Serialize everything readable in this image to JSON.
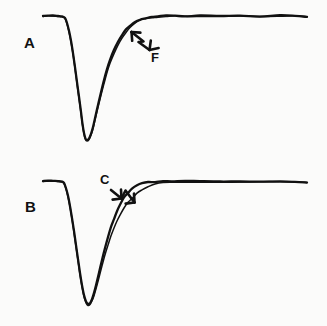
{
  "figure": {
    "width": 327,
    "height": 326,
    "background_color": "#fbfbfa",
    "trace_color": "#111111"
  },
  "panels": [
    {
      "id": "A",
      "label": "A",
      "annotations": [
        {
          "id": "F",
          "label": "F",
          "icon": "double-chevron-arrow-up-left-icon",
          "direction": "up-left"
        }
      ]
    },
    {
      "id": "B",
      "label": "B",
      "annotations": [
        {
          "id": "C",
          "label": "C",
          "icon": "double-chevron-arrow-down-right-icon",
          "direction": "down-right"
        }
      ]
    }
  ],
  "chart_data": {
    "type": "line",
    "title": "",
    "xlabel": "",
    "ylabel": "",
    "xlim": [
      0,
      327
    ],
    "ylim": [
      0,
      163
    ],
    "grid": false,
    "legend": "none",
    "axes_visible": false,
    "panels": [
      {
        "panel": "A",
        "panel_label": "A",
        "annotation_label": "F",
        "baseline_y": 16,
        "peak_x": 83,
        "peak_y": 140,
        "plateau_y": 16,
        "series": [
          {
            "name": "trace-A-1",
            "points": [
              [
                43,
                16
              ],
              [
                48,
                15.6
              ],
              [
                53,
                15.7
              ],
              [
                58,
                16
              ],
              [
                62,
                16.4
              ],
              [
                65,
                18
              ],
              [
                67,
                23
              ],
              [
                69,
                31
              ],
              [
                71,
                41
              ],
              [
                73,
                53
              ],
              [
                75,
                67
              ],
              [
                77,
                82
              ],
              [
                79,
                97
              ],
              [
                81,
                112
              ],
              [
                82.5,
                124
              ],
              [
                84,
                133
              ],
              [
                85.5,
                138.5
              ],
              [
                87,
                140
              ],
              [
                89,
                138.5
              ],
              [
                91,
                134
              ],
              [
                93,
                127
              ],
              [
                95,
                118
              ],
              [
                98,
                105
              ],
              [
                101,
                92
              ],
              [
                104,
                80
              ],
              [
                107,
                69
              ],
              [
                110,
                60
              ],
              [
                114,
                50
              ],
              [
                118,
                42
              ],
              [
                122,
                35
              ],
              [
                126,
                30
              ],
              [
                130,
                26
              ],
              [
                135,
                22
              ],
              [
                140,
                19.5
              ],
              [
                146,
                17.8
              ],
              [
                152,
                16.8
              ],
              [
                158,
                16.3
              ],
              [
                166,
                16
              ],
              [
                175,
                15.8
              ],
              [
                185,
                15.8
              ],
              [
                200,
                15.9
              ],
              [
                220,
                16
              ],
              [
                240,
                15.8
              ],
              [
                260,
                16
              ],
              [
                280,
                15.9
              ],
              [
                295,
                16.2
              ],
              [
                307,
                17
              ]
            ]
          },
          {
            "name": "trace-A-2",
            "points": [
              [
                43,
                16.4
              ],
              [
                48,
                16
              ],
              [
                53,
                16.1
              ],
              [
                58,
                16.3
              ],
              [
                62,
                16.8
              ],
              [
                65,
                18.6
              ],
              [
                67,
                23.8
              ],
              [
                69,
                32
              ],
              [
                71,
                42
              ],
              [
                73,
                54
              ],
              [
                75,
                68.5
              ],
              [
                77,
                83.5
              ],
              [
                79,
                98.5
              ],
              [
                81,
                113
              ],
              [
                82.5,
                125
              ],
              [
                84,
                134
              ],
              [
                85.5,
                139.5
              ],
              [
                87,
                141
              ],
              [
                89,
                139.5
              ],
              [
                91,
                135
              ],
              [
                93,
                128.5
              ],
              [
                95,
                120
              ],
              [
                98,
                107.5
              ],
              [
                101,
                95
              ],
              [
                104,
                83.5
              ],
              [
                107,
                72.5
              ],
              [
                110,
                63.5
              ],
              [
                114,
                53.5
              ],
              [
                118,
                45
              ],
              [
                122,
                38
              ],
              [
                126,
                32.5
              ],
              [
                130,
                28
              ],
              [
                135,
                23.5
              ],
              [
                140,
                20.5
              ],
              [
                146,
                18.4
              ],
              [
                152,
                17.2
              ],
              [
                158,
                16.6
              ],
              [
                166,
                16.2
              ],
              [
                175,
                16
              ],
              [
                185,
                16
              ],
              [
                200,
                16.1
              ],
              [
                220,
                16.2
              ],
              [
                240,
                16
              ],
              [
                260,
                16.2
              ],
              [
                280,
                16.1
              ],
              [
                295,
                16.4
              ],
              [
                307,
                17.2
              ]
            ]
          }
        ]
      },
      {
        "panel": "B",
        "panel_label": "B",
        "annotation_label": "C",
        "baseline_y": 18,
        "peak_x": 85,
        "peak_y": 141,
        "plateau_y": 19,
        "series": [
          {
            "name": "trace-B-1",
            "points": [
              [
                43,
                18
              ],
              [
                48,
                17.6
              ],
              [
                53,
                17.7
              ],
              [
                58,
                18
              ],
              [
                62,
                18.5
              ],
              [
                64,
                20
              ],
              [
                66,
                25
              ],
              [
                68,
                33
              ],
              [
                70,
                43
              ],
              [
                72,
                55
              ],
              [
                74,
                68
              ],
              [
                76,
                82
              ],
              [
                78,
                96
              ],
              [
                80,
                110
              ],
              [
                82,
                122
              ],
              [
                84,
                132
              ],
              [
                86,
                138.5
              ],
              [
                88,
                141
              ],
              [
                90,
                140
              ],
              [
                92,
                136
              ],
              [
                94,
                130
              ],
              [
                96,
                122
              ],
              [
                99,
                110
              ],
              [
                102,
                97
              ],
              [
                105,
                85
              ],
              [
                108,
                74
              ],
              [
                111,
                64
              ],
              [
                114,
                56
              ],
              [
                117,
                48
              ],
              [
                120,
                42
              ],
              [
                124,
                35
              ],
              [
                128,
                30
              ],
              [
                132,
                26
              ],
              [
                137,
                22.5
              ],
              [
                142,
                20.5
              ],
              [
                148,
                19.3
              ],
              [
                155,
                18.6
              ],
              [
                163,
                18.3
              ],
              [
                172,
                18.2
              ],
              [
                185,
                18.3
              ],
              [
                200,
                18.4
              ],
              [
                220,
                18.5
              ],
              [
                240,
                18.4
              ],
              [
                260,
                18.6
              ],
              [
                280,
                18.5
              ],
              [
                295,
                18.8
              ],
              [
                307,
                19.5
              ]
            ]
          },
          {
            "name": "trace-B-2",
            "points": [
              [
                43,
                18.4
              ],
              [
                48,
                18
              ],
              [
                53,
                18.1
              ],
              [
                58,
                18.4
              ],
              [
                62,
                19
              ],
              [
                64,
                20.6
              ],
              [
                66,
                25.8
              ],
              [
                68,
                34
              ],
              [
                70,
                44
              ],
              [
                72,
                56
              ],
              [
                74,
                69.5
              ],
              [
                76,
                83.5
              ],
              [
                78,
                97.5
              ],
              [
                80,
                111.5
              ],
              [
                82,
                123.5
              ],
              [
                84,
                133.5
              ],
              [
                86,
                140
              ],
              [
                88,
                142.5
              ],
              [
                90,
                141.5
              ],
              [
                92,
                138
              ],
              [
                94,
                132.5
              ],
              [
                96,
                125.5
              ],
              [
                99,
                114.5
              ],
              [
                102,
                103
              ],
              [
                105,
                92
              ],
              [
                108,
                82
              ],
              [
                111,
                73
              ],
              [
                114,
                65
              ],
              [
                117,
                58
              ],
              [
                120,
                52
              ],
              [
                124,
                45
              ],
              [
                128,
                39.5
              ],
              [
                132,
                35
              ],
              [
                137,
                30
              ],
              [
                142,
                26.5
              ],
              [
                148,
                23.5
              ],
              [
                155,
                21.3
              ],
              [
                163,
                20
              ],
              [
                172,
                19.2
              ],
              [
                185,
                18.8
              ],
              [
                200,
                18.7
              ],
              [
                220,
                18.8
              ],
              [
                240,
                18.7
              ],
              [
                260,
                18.9
              ],
              [
                280,
                18.8
              ],
              [
                295,
                19.1
              ],
              [
                307,
                19.8
              ]
            ]
          }
        ]
      }
    ]
  }
}
